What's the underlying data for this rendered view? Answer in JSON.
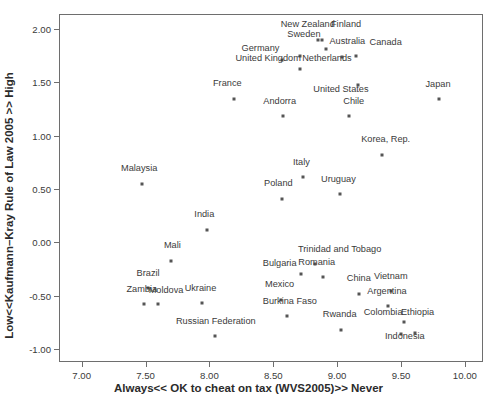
{
  "chart_data": {
    "type": "scatter",
    "title": "",
    "xlabel": "Always<< OK to cheat on tax (WVS2005)>> Never",
    "ylabel": "Low<<Kaufmann–Kray Rule of Law 2005 >> High",
    "xlim": [
      6.83,
      10.15
    ],
    "ylim": [
      -1.13,
      2.13
    ],
    "xticks": [
      "7.00",
      "7.50",
      "8.00",
      "8.50",
      "9.00",
      "9.50",
      "10.00"
    ],
    "yticks": [
      "2.00",
      "1.50",
      "1.00",
      "0.50",
      "0.00",
      "-0.50",
      "-1.00"
    ],
    "grid": false,
    "legend": null,
    "marker_color": "#555555",
    "points": [
      {
        "label": "New Zealand",
        "x": 8.88,
        "y": 1.9,
        "lx": 8.77,
        "ly": 1.99
      },
      {
        "label": "Finland",
        "x": 8.85,
        "y": 1.9,
        "lx": 9.07,
        "ly": 1.99
      },
      {
        "label": "Sweden",
        "x": 8.91,
        "y": 1.81,
        "lx": 8.74,
        "ly": 1.9
      },
      {
        "label": "Australia",
        "x": 9.04,
        "y": 1.74,
        "lx": 9.08,
        "ly": 1.83
      },
      {
        "label": "Canada",
        "x": 9.15,
        "y": 1.75,
        "lx": 9.38,
        "ly": 1.82
      },
      {
        "label": "Germany",
        "x": 8.57,
        "y": 1.71,
        "lx": 8.4,
        "ly": 1.76
      },
      {
        "label": "Netherlands",
        "x": 8.71,
        "y": 1.75,
        "lx": 8.92,
        "ly": 1.67
      },
      {
        "label": "United Kingdom",
        "x": 8.71,
        "y": 1.62,
        "lx": 8.46,
        "ly": 1.67
      },
      {
        "label": "United States",
        "x": 9.16,
        "y": 1.47,
        "lx": 9.03,
        "ly": 1.38
      },
      {
        "label": "France",
        "x": 8.19,
        "y": 1.34,
        "lx": 8.14,
        "ly": 1.44
      },
      {
        "label": "Japan",
        "x": 9.8,
        "y": 1.34,
        "lx": 9.79,
        "ly": 1.43
      },
      {
        "label": "Chile",
        "x": 9.09,
        "y": 1.18,
        "lx": 9.13,
        "ly": 1.27
      },
      {
        "label": "Andorra",
        "x": 8.58,
        "y": 1.18,
        "lx": 8.55,
        "ly": 1.27
      },
      {
        "label": "Korea, Rep.",
        "x": 9.35,
        "y": 0.82,
        "lx": 9.38,
        "ly": 0.91
      },
      {
        "label": "Malaysia",
        "x": 7.47,
        "y": 0.55,
        "lx": 7.45,
        "ly": 0.64
      },
      {
        "label": "Italy",
        "x": 8.73,
        "y": 0.61,
        "lx": 8.72,
        "ly": 0.7
      },
      {
        "label": "Uruguay",
        "x": 9.02,
        "y": 0.45,
        "lx": 9.01,
        "ly": 0.54
      },
      {
        "label": "Poland",
        "x": 8.57,
        "y": 0.41,
        "lx": 8.54,
        "ly": 0.5
      },
      {
        "label": "India",
        "x": 7.98,
        "y": 0.12,
        "lx": 7.96,
        "ly": 0.21
      },
      {
        "label": "Mali",
        "x": 7.7,
        "y": -0.17,
        "lx": 7.71,
        "ly": -0.08
      },
      {
        "label": "Trinidad and Tobago",
        "x": 8.83,
        "y": -0.2,
        "lx": 9.02,
        "ly": -0.12
      },
      {
        "label": "Bulgaria",
        "x": 8.72,
        "y": -0.3,
        "lx": 8.55,
        "ly": -0.25
      },
      {
        "label": "Romania",
        "x": 8.89,
        "y": -0.32,
        "lx": 8.84,
        "ly": -0.24
      },
      {
        "label": "Brazil",
        "x": 7.52,
        "y": -0.43,
        "lx": 7.52,
        "ly": -0.34
      },
      {
        "label": "China",
        "x": 9.17,
        "y": -0.48,
        "lx": 9.17,
        "ly": -0.39
      },
      {
        "label": "Vietnam",
        "x": 9.42,
        "y": -0.46,
        "lx": 9.42,
        "ly": -0.37
      },
      {
        "label": "Mexico",
        "x": 8.56,
        "y": -0.54,
        "lx": 8.55,
        "ly": -0.45
      },
      {
        "label": "Zambia",
        "x": 7.49,
        "y": -0.58,
        "lx": 7.47,
        "ly": -0.49
      },
      {
        "label": "Moldova",
        "x": 7.6,
        "y": -0.58,
        "lx": 7.66,
        "ly": -0.5
      },
      {
        "label": "Ukraine",
        "x": 7.94,
        "y": -0.57,
        "lx": 7.93,
        "ly": -0.48
      },
      {
        "label": "Argentina",
        "x": 9.4,
        "y": -0.6,
        "lx": 9.39,
        "ly": -0.51
      },
      {
        "label": "Burkina Faso",
        "x": 8.61,
        "y": -0.69,
        "lx": 8.63,
        "ly": -0.61
      },
      {
        "label": "Rwanda",
        "x": 9.03,
        "y": -0.82,
        "lx": 9.02,
        "ly": -0.73
      },
      {
        "label": "Colombia",
        "x": 9.52,
        "y": -0.75,
        "lx": 9.36,
        "ly": -0.71
      },
      {
        "label": "Ethiopia",
        "x": 9.61,
        "y": -0.85,
        "lx": 9.63,
        "ly": -0.71
      },
      {
        "label": "Indonesia",
        "x": 9.5,
        "y": -0.86,
        "lx": 9.53,
        "ly": -0.93
      },
      {
        "label": "Russian Federation",
        "x": 8.04,
        "y": -0.88,
        "lx": 8.05,
        "ly": -0.79
      }
    ]
  }
}
